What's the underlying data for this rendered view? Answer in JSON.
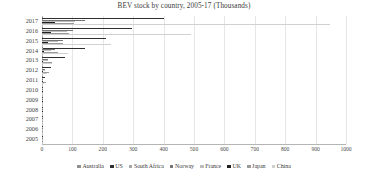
{
  "chart_data": {
    "type": "bar",
    "orientation": "horizontal",
    "title": "BEV stock by country, 2005-17 (Thousands)",
    "xlabel": "",
    "ylabel": "",
    "xlim": [
      0,
      1000
    ],
    "xticks": [
      0,
      100,
      200,
      300,
      400,
      500,
      600,
      700,
      800,
      900,
      1000
    ],
    "grid": true,
    "legend_position": "bottom",
    "categories": [
      "2017",
      "2016",
      "2015",
      "2014",
      "2013",
      "2012",
      "2011",
      "2010",
      "2009",
      "2008",
      "2007",
      "2006",
      "2005"
    ],
    "series": [
      {
        "name": "Australia",
        "color": "#8f8f8f",
        "values": [
          3.0,
          1.8,
          1.1,
          0.9,
          0.3,
          0.2,
          0.1,
          0.0,
          0.0,
          0.0,
          0.0,
          0.0,
          0.0
        ]
      },
      {
        "name": "US",
        "color": "#2f2f2f",
        "values": [
          402.0,
          297.0,
          210.0,
          140.0,
          77.0,
          28.0,
          9.0,
          1.5,
          0.5,
          0.3,
          0.2,
          0.1,
          0.1
        ]
      },
      {
        "name": "South Africa",
        "color": "#a8a8a8",
        "values": [
          0.6,
          0.4,
          0.3,
          0.1,
          0.0,
          0.0,
          0.0,
          0.0,
          0.0,
          0.0,
          0.0,
          0.0,
          0.0
        ]
      },
      {
        "name": "Norway",
        "color": "#757575",
        "values": [
          142.0,
          101.0,
          69.0,
          43.0,
          19.0,
          9.5,
          4.5,
          2.5,
          1.8,
          1.2,
          0.8,
          0.5,
          0.3
        ]
      },
      {
        "name": "France",
        "color": "#bdbdbd",
        "values": [
          110.0,
          82.0,
          54.0,
          31.0,
          19.0,
          10.0,
          4.0,
          1.0,
          0.4,
          0.2,
          0.2,
          0.1,
          0.1
        ]
      },
      {
        "name": "UK",
        "color": "#1f1f1f",
        "values": [
          44.0,
          31.0,
          20.0,
          7.0,
          3.0,
          1.4,
          0.8,
          0.2,
          0.1,
          0.1,
          0.0,
          0.0,
          0.0
        ]
      },
      {
        "name": "Japan",
        "color": "#9a9a9a",
        "values": [
          105.0,
          90.0,
          70.0,
          53.0,
          34.0,
          22.0,
          12.0,
          2.0,
          0.6,
          0.2,
          0.1,
          0.1,
          0.1
        ]
      },
      {
        "name": "China",
        "color": "#d0d0d0",
        "values": [
          948.0,
          489.0,
          226.0,
          84.0,
          32.0,
          16.0,
          7.0,
          1.0,
          0.3,
          0.1,
          0.1,
          0.0,
          0.0
        ]
      }
    ]
  }
}
